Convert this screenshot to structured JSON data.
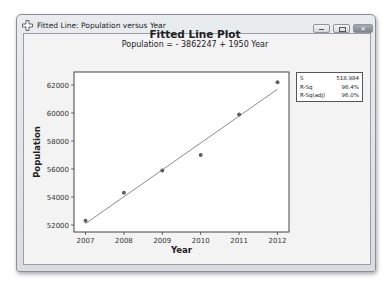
{
  "window": {
    "title": "Fitted Line: Population versus Year",
    "app_icon": "minitab-cross-icon",
    "buttons": {
      "minimize": "minimize-icon",
      "maximize": "maximize-icon",
      "close": "close-icon"
    }
  },
  "chart": {
    "title": "Fitted Line Plot",
    "subtitle": "Population = - 3862247 + 1950 Year",
    "xlabel": "Year",
    "ylabel": "Population",
    "stats": [
      {
        "label": "S",
        "value": "518.984"
      },
      {
        "label": "R-Sq",
        "value": "96.4%"
      },
      {
        "label": "R-Sq(adj)",
        "value": "96.0%"
      }
    ]
  },
  "chart_data": {
    "type": "scatter",
    "title": "Fitted Line Plot",
    "subtitle": "Population = - 3862247 + 1950 Year",
    "xlabel": "Year",
    "ylabel": "Population",
    "x": [
      2007,
      2008,
      2009,
      2010,
      2011,
      2012
    ],
    "series": [
      {
        "name": "Population",
        "values": [
          52300,
          54300,
          55900,
          57000,
          59900,
          62200
        ]
      }
    ],
    "fit_line": {
      "intercept": -3862247,
      "slope": 1950,
      "start": [
        2007,
        52100
      ],
      "end": [
        2012,
        61700
      ]
    },
    "xticks": [
      2007,
      2008,
      2009,
      2010,
      2011,
      2012
    ],
    "yticks": [
      52000,
      54000,
      56000,
      58000,
      60000,
      62000
    ],
    "xlim": [
      2006.75,
      2012.25
    ],
    "ylim": [
      51500,
      62900
    ],
    "grid": false,
    "legend": {
      "position": "right",
      "entries": [
        {
          "label": "S",
          "value": "518.984"
        },
        {
          "label": "R-Sq",
          "value": "96.4%"
        },
        {
          "label": "R-Sq(adj)",
          "value": "96.0%"
        }
      ]
    },
    "colors": {
      "points": "#606060",
      "line": "#808080"
    }
  }
}
